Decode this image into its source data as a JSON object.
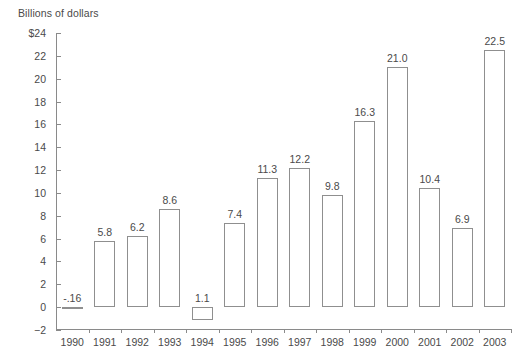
{
  "chart_data": {
    "type": "bar",
    "title": "",
    "subtitle": "",
    "axis_title": "Billions of dollars",
    "xlabel": "",
    "ylabel": "Billions of dollars",
    "categories": [
      "1990",
      "1991",
      "1992",
      "1993",
      "1994",
      "1995",
      "1996",
      "1997",
      "1998",
      "1999",
      "2000",
      "2001",
      "2002",
      "2003"
    ],
    "values": [
      -0.16,
      5.8,
      6.2,
      8.6,
      -1.1,
      7.4,
      11.3,
      12.2,
      9.8,
      16.3,
      21.0,
      10.4,
      6.9,
      22.5
    ],
    "data_labels": [
      "-.16",
      "5.8",
      "6.2",
      "8.6",
      "1.1",
      "7.4",
      "11.3",
      "12.2",
      "9.8",
      "16.3",
      "21.0",
      "10.4",
      "6.9",
      "22.5"
    ],
    "ylim": [
      -2,
      24
    ],
    "ytick_values": [
      -2,
      0,
      2,
      4,
      6,
      8,
      10,
      12,
      14,
      16,
      18,
      20,
      22,
      24
    ],
    "ytick_labels": [
      "−2",
      "0",
      "2",
      "4",
      "6",
      "8",
      "10",
      "12",
      "14",
      "16",
      "18",
      "20",
      "22",
      "$24"
    ],
    "grid": false,
    "legend": null,
    "legend_position": "none",
    "bar_fill_color": "#ffffff",
    "bar_border_color": "#8f8f8f",
    "axis_color": "#8a8a8a",
    "text_color": "#4a4a4a"
  }
}
